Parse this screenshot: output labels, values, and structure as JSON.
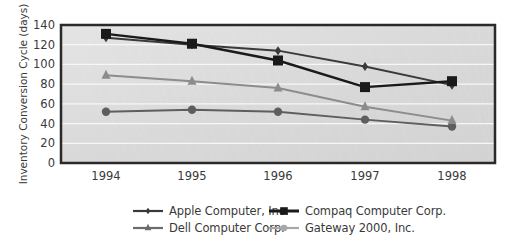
{
  "chart_data": {
    "type": "line",
    "title": "",
    "xlabel": "",
    "ylabel": "Inventory Conversion Cycle (days)",
    "categories": [
      "1994",
      "1995",
      "1996",
      "1997",
      "1998"
    ],
    "ylim": [
      0,
      140
    ],
    "yticks": [
      0,
      20,
      40,
      60,
      80,
      100,
      120,
      140
    ],
    "grid": true,
    "legend_position": "bottom",
    "series": [
      {
        "name": "Apple Computer, Inc.",
        "marker": "diamond",
        "color": "#3a3a3a",
        "values": [
          127,
          120,
          114,
          98,
          79
        ]
      },
      {
        "name": "Compaq Computer Corp.",
        "marker": "square",
        "color": "#1a1a1a",
        "values": [
          131,
          121,
          104,
          77,
          83
        ]
      },
      {
        "name": "Dell Computer Corp.",
        "marker": "triangle",
        "color": "#8c8c8c",
        "values": [
          89,
          83,
          76,
          57,
          43
        ]
      },
      {
        "name": "Gateway 2000, Inc.",
        "marker": "circle",
        "color": "#5e5e5e",
        "values": [
          52,
          54,
          52,
          44,
          37
        ]
      }
    ]
  },
  "legend": {
    "items": [
      {
        "label": "Apple Computer, Inc.",
        "marker": "diamond",
        "color": "#3a3a3a"
      },
      {
        "label": "Compaq Computer Corp.",
        "marker": "square",
        "color": "#1a1a1a"
      },
      {
        "label": "Dell Computer Corp.",
        "marker": "triangle",
        "color": "#6c6c6c"
      },
      {
        "label": "Gateway 2000, Inc.",
        "marker": "circle",
        "color": "#a8a8a8"
      }
    ]
  }
}
